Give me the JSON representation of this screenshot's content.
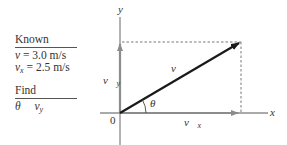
{
  "known": {
    "header": "Known",
    "items": [
      {
        "symbol": "v",
        "subscript": "",
        "value": " = 3.0 m/s"
      },
      {
        "symbol": "v",
        "subscript": "x",
        "value": " = 2.5 m/s"
      }
    ]
  },
  "find": {
    "header": "Find",
    "items": [
      {
        "symbol": "θ",
        "subscript": ""
      },
      {
        "symbol": "v",
        "subscript": "y"
      }
    ]
  },
  "diagram": {
    "axis_x_label": "x",
    "axis_y_label": "y",
    "origin_label": "0",
    "angle_label": "θ",
    "vector_v_label": "v⃗",
    "vector_vx_label": "v⃗",
    "vector_vx_sub": "x",
    "vector_vy_label": "v⃗",
    "vector_vy_sub": "y",
    "colors": {
      "axis": "#555555",
      "component_arrow": "#8c8c8c",
      "resultant_arrow": "#1a1a1a",
      "dashed": "#555555"
    }
  }
}
